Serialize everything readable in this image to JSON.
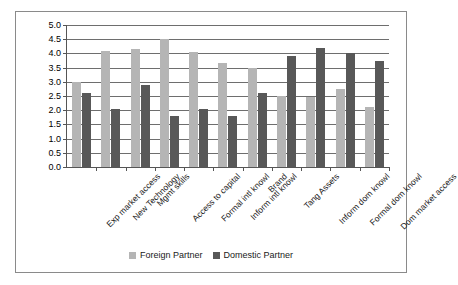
{
  "chart_data": {
    "type": "bar",
    "title": "",
    "xlabel": "",
    "ylabel": "",
    "ylim": [
      0.0,
      5.0
    ],
    "ytick_step": 0.5,
    "yticks": [
      "0.0",
      "0.5",
      "1.0",
      "1.5",
      "2.0",
      "2.5",
      "3.0",
      "3.5",
      "4.0",
      "4.5",
      "5.0"
    ],
    "grid": true,
    "legend_position": "bottom-center",
    "categories": [
      "Exp market access",
      "New Technology",
      "Mgmt skills",
      "Access to capital",
      "Formal intl knowl",
      "Inform intl knowl",
      "Brand",
      "Tang Assets",
      "Inform dom knowl",
      "Formal dom knowl",
      "Dom market access"
    ],
    "series": [
      {
        "name": "Foreign Partner",
        "color": "#b5b5b5",
        "values": [
          3.0,
          4.1,
          4.15,
          4.5,
          4.05,
          3.65,
          3.5,
          2.5,
          2.45,
          2.75,
          2.1
        ]
      },
      {
        "name": "Domestic Partner",
        "color": "#585858",
        "values": [
          2.6,
          2.05,
          2.9,
          1.8,
          2.05,
          1.8,
          2.6,
          3.9,
          4.2,
          4.0,
          3.75
        ]
      }
    ]
  },
  "legend": {
    "items": [
      {
        "label": "Foreign Partner",
        "swatch": "foreign"
      },
      {
        "label": "Domestic Partner",
        "swatch": "domestic"
      }
    ]
  }
}
